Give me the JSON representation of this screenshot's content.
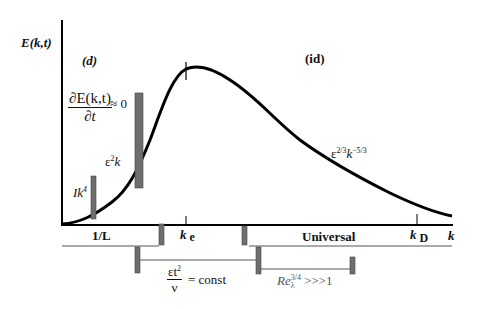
{
  "axes": {
    "ylabel": "E(k,t)",
    "xlabel": "k"
  },
  "regions": {
    "dissipative_label": "(d)",
    "inertial_label": "(id)"
  },
  "annotations": {
    "dEdt_numerator": "∂E(k,t)",
    "dEdt_denominator": "∂t",
    "dEdt_rhs": "≈ 0",
    "eps2k_base": "ε",
    "eps2k_exp": "2",
    "eps2k_tail": "k",
    "Ik4_base": "Ik",
    "Ik4_exp": "4",
    "kolmogorov_base1": "ε",
    "kolmogorov_exp1": "2/3",
    "kolmogorov_base2": "k",
    "kolmogorov_exp2": "−5/3"
  },
  "ticks": {
    "one_over_L": "1/L",
    "ke_base": "k",
    "ke_sub": "e",
    "kD_base": "k",
    "kD_sub": "D",
    "universal": "Universal"
  },
  "conditions": {
    "eps_t2_num_base": "εt",
    "eps_t2_num_exp": "2",
    "eps_t2_den": "ν",
    "eps_t2_rhs": "= const",
    "re_base": "Re",
    "re_exp": "3/4",
    "re_sub": "λ",
    "re_rhs": ">>>1"
  },
  "colors": {
    "curve": "#000000",
    "bar_fill": "#6e6e6e",
    "bar_stroke": "#444444",
    "axis": "#000000",
    "range_line": "#555555"
  }
}
